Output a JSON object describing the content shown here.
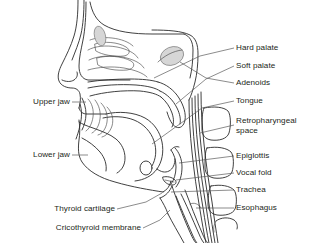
{
  "figure": {
    "background_color": "#ffffff",
    "line_color": "#2b2b2b",
    "leader_color": "#5a5a5a",
    "shade_color": "#d6d6d6",
    "text_color": "#231f20"
  },
  "labels": {
    "right": [
      {
        "id": "hard-palate",
        "text": "Hard palate"
      },
      {
        "id": "soft-palate",
        "text": "Soft palate"
      },
      {
        "id": "adenoids",
        "text": "Adenoids"
      },
      {
        "id": "tongue",
        "text": "Tongue"
      },
      {
        "id": "retropharyngeal-space",
        "text": "Retropharyngeal space"
      },
      {
        "id": "epiglottis",
        "text": "Epiglottis"
      },
      {
        "id": "vocal-fold",
        "text": "Vocal fold"
      },
      {
        "id": "trachea",
        "text": "Trachea"
      },
      {
        "id": "esophagus",
        "text": "Esophagus"
      }
    ],
    "left": [
      {
        "id": "upper-jaw",
        "text": "Upper jaw"
      },
      {
        "id": "lower-jaw",
        "text": "Lower jaw"
      },
      {
        "id": "thyroid-cartilage",
        "text": "Thyroid cartilage"
      },
      {
        "id": "cricothyroid-membrane",
        "text": "Cricothyroid membrane"
      }
    ]
  }
}
